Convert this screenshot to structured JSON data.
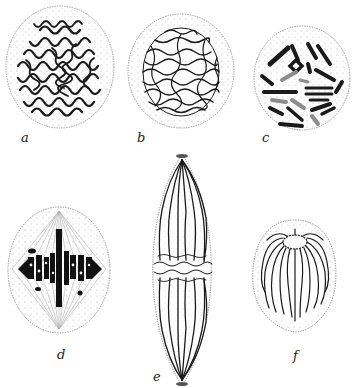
{
  "figure": {
    "colors": {
      "ink": "#1a1a1a",
      "stipple": "#9a9a9a",
      "membrane": "#8a8a8a",
      "background": "#ffffff"
    },
    "panels": [
      {
        "id": "a",
        "label": "a",
        "stage": "chromatin network (early prophase)"
      },
      {
        "id": "b",
        "label": "b",
        "stage": "spireme thread (prophase)"
      },
      {
        "id": "c",
        "label": "c",
        "stage": "condensed chromosomes (late prophase)"
      },
      {
        "id": "d",
        "label": "d",
        "stage": "metaphase plate with spindle"
      },
      {
        "id": "e",
        "label": "e",
        "stage": "anaphase, elongated spindle"
      },
      {
        "id": "f",
        "label": "f",
        "stage": "telophase daughter nucleus"
      }
    ]
  }
}
